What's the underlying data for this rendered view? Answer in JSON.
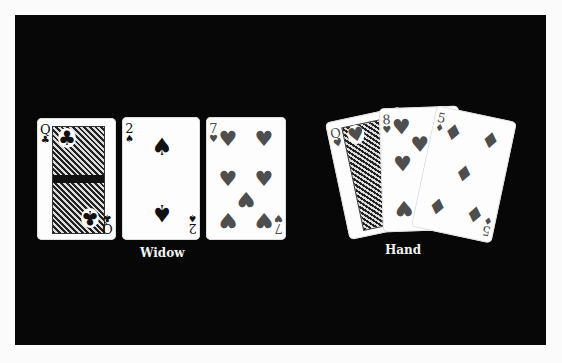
{
  "scene": {
    "background_color": "#070707",
    "page_color": "#fbfbfb"
  },
  "widow": {
    "label": "Widow",
    "cards": [
      {
        "rank": "Q",
        "suit": "clubs",
        "suit_glyph": "♣",
        "color": "black"
      },
      {
        "rank": "2",
        "suit": "spades",
        "suit_glyph": "♠",
        "color": "black"
      },
      {
        "rank": "7",
        "suit": "hearts",
        "suit_glyph": "♥",
        "color": "red"
      }
    ]
  },
  "hand": {
    "label": "Hand",
    "cards": [
      {
        "rank": "Q",
        "suit": "hearts",
        "suit_glyph": "♥",
        "color": "red"
      },
      {
        "rank": "8",
        "suit": "hearts",
        "suit_glyph": "♥",
        "color": "red"
      },
      {
        "rank": "5",
        "suit": "diamonds",
        "suit_glyph": "♦",
        "color": "red"
      }
    ]
  },
  "colors": {
    "black_suit": "#111111",
    "red_suit": "#4e4e4e",
    "label_text": "#f2f2f2"
  }
}
